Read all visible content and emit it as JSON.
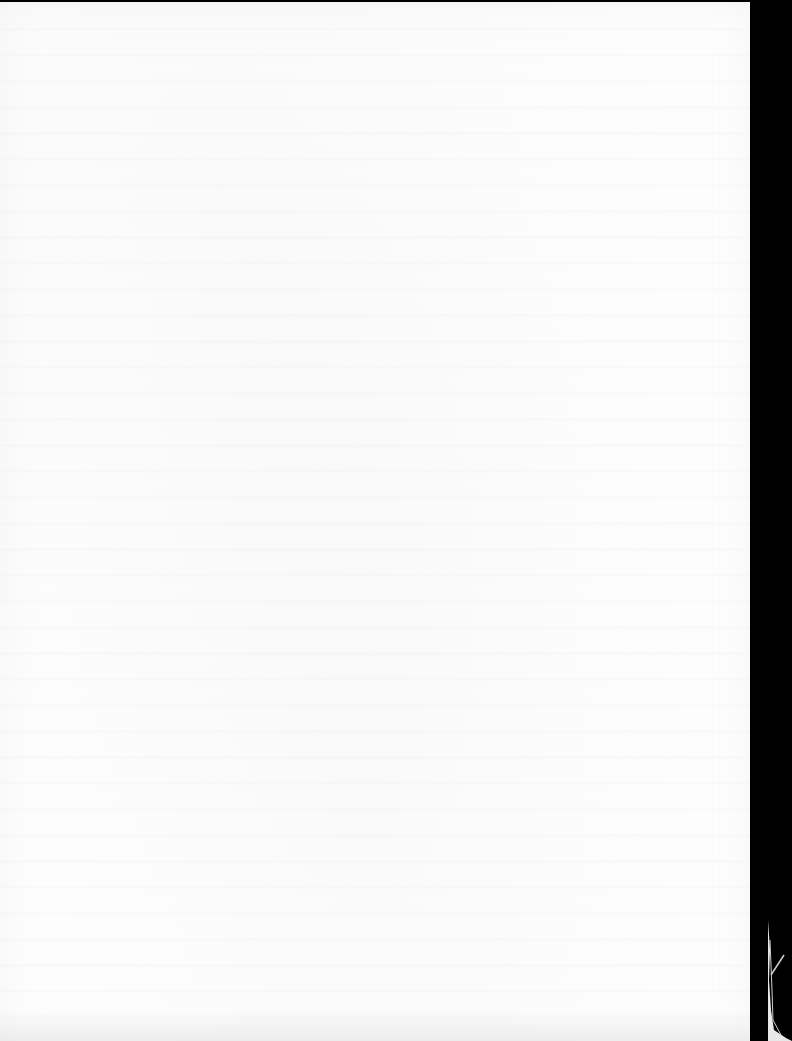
{
  "document": {
    "type": "scanned page",
    "content": "",
    "note": "Blank page with faint, illegible bleed-through from the reverse side"
  },
  "colors": {
    "paper": "#fdfdfd",
    "scanner_background": "#000000"
  }
}
